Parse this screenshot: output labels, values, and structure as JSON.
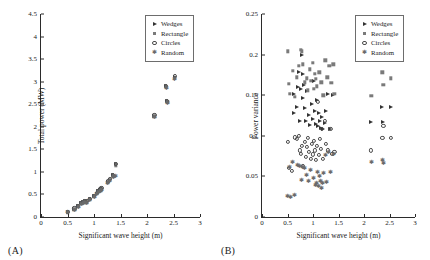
{
  "figure": {
    "panels": [
      {
        "tag": "(A)",
        "xlabel": "Significant wave height (m)",
        "ylabel": "Total power (MW)",
        "xticks": [
          "0",
          "0.5",
          "1",
          "1.5",
          "2",
          "2.5",
          "3"
        ],
        "yticks": [
          "0",
          "0.5",
          "1",
          "1.5",
          "2",
          "2.5",
          "3",
          "3.5",
          "4",
          "4.5"
        ]
      },
      {
        "tag": "(B)",
        "xlabel": "Significant wave height (m)",
        "ylabel": "Power variance",
        "xticks": [
          "0",
          "0.5",
          "1",
          "1.5",
          "2",
          "2.5",
          "3"
        ],
        "yticks": [
          "0",
          "0.05",
          "0.1",
          "0.15",
          "0.2",
          "0.25"
        ]
      }
    ],
    "legend": [
      {
        "label": "Wedges",
        "marker": "wedge-marker"
      },
      {
        "label": "Rectangle",
        "marker": "rectangle-marker"
      },
      {
        "label": "Circles",
        "marker": "circle-marker"
      },
      {
        "label": "Random",
        "marker": "random-marker"
      }
    ]
  },
  "chart_data": [
    {
      "type": "scatter",
      "title": "(A)",
      "xlabel": "Significant wave height (m)",
      "ylabel": "Total power (MW)",
      "xlim": [
        0,
        3
      ],
      "ylim": [
        0,
        4.5
      ],
      "xticks": [
        0,
        0.5,
        1,
        1.5,
        2,
        2.5,
        3
      ],
      "yticks": [
        0,
        0.5,
        1,
        1.5,
        2,
        2.5,
        3,
        3.5,
        4,
        4.5
      ],
      "grid": false,
      "legend_position": "top-right",
      "series": [
        {
          "name": "Wedges",
          "points": [
            [
              0.5,
              0.11
            ],
            [
              0.63,
              0.18
            ],
            [
              0.7,
              0.24
            ],
            [
              0.76,
              0.3
            ],
            [
              0.8,
              0.33
            ],
            [
              0.83,
              0.35
            ],
            [
              0.86,
              0.34
            ],
            [
              0.92,
              0.4
            ],
            [
              1.0,
              0.46
            ],
            [
              1.05,
              0.52
            ],
            [
              1.08,
              0.57
            ],
            [
              1.12,
              0.6
            ],
            [
              1.14,
              0.63
            ],
            [
              1.26,
              0.78
            ],
            [
              1.3,
              0.83
            ],
            [
              1.36,
              0.92
            ],
            [
              1.41,
              1.17
            ],
            [
              2.14,
              2.25
            ],
            [
              2.36,
              2.9
            ],
            [
              2.38,
              2.57
            ],
            [
              2.52,
              3.1
            ]
          ]
        },
        {
          "name": "Rectangle",
          "points": [
            [
              0.5,
              0.1
            ],
            [
              0.63,
              0.17
            ],
            [
              0.7,
              0.23
            ],
            [
              0.76,
              0.29
            ],
            [
              0.8,
              0.32
            ],
            [
              0.83,
              0.34
            ],
            [
              0.86,
              0.33
            ],
            [
              0.92,
              0.39
            ],
            [
              1.0,
              0.45
            ],
            [
              1.05,
              0.51
            ],
            [
              1.08,
              0.56
            ],
            [
              1.12,
              0.59
            ],
            [
              1.14,
              0.62
            ],
            [
              1.26,
              0.77
            ],
            [
              1.3,
              0.82
            ],
            [
              1.36,
              0.9
            ],
            [
              1.41,
              1.15
            ],
            [
              2.14,
              2.23
            ],
            [
              2.36,
              2.88
            ],
            [
              2.38,
              2.55
            ],
            [
              2.52,
              3.08
            ]
          ]
        },
        {
          "name": "Circles",
          "points": [
            [
              0.5,
              0.12
            ],
            [
              0.63,
              0.19
            ],
            [
              0.7,
              0.25
            ],
            [
              0.76,
              0.31
            ],
            [
              0.8,
              0.34
            ],
            [
              0.83,
              0.36
            ],
            [
              0.86,
              0.35
            ],
            [
              0.92,
              0.41
            ],
            [
              1.0,
              0.47
            ],
            [
              1.05,
              0.53
            ],
            [
              1.08,
              0.58
            ],
            [
              1.12,
              0.61
            ],
            [
              1.14,
              0.64
            ],
            [
              1.26,
              0.79
            ],
            [
              1.3,
              0.84
            ],
            [
              1.36,
              0.93
            ],
            [
              1.41,
              1.18
            ],
            [
              2.14,
              2.26
            ],
            [
              2.36,
              2.91
            ],
            [
              2.38,
              2.58
            ],
            [
              2.52,
              3.12
            ]
          ]
        },
        {
          "name": "Random",
          "points": [
            [
              0.5,
              0.1
            ],
            [
              0.63,
              0.16
            ],
            [
              0.7,
              0.22
            ],
            [
              0.76,
              0.28
            ],
            [
              0.8,
              0.31
            ],
            [
              0.83,
              0.33
            ],
            [
              0.86,
              0.32
            ],
            [
              0.92,
              0.38
            ],
            [
              1.0,
              0.44
            ],
            [
              1.05,
              0.5
            ],
            [
              1.08,
              0.55
            ],
            [
              1.12,
              0.58
            ],
            [
              1.14,
              0.6
            ],
            [
              1.26,
              0.75
            ],
            [
              1.3,
              0.8
            ],
            [
              1.36,
              0.88
            ],
            [
              1.41,
              0.9
            ],
            [
              2.14,
              2.21
            ],
            [
              2.36,
              2.86
            ],
            [
              2.38,
              2.53
            ],
            [
              2.52,
              3.06
            ]
          ]
        }
      ]
    },
    {
      "type": "scatter",
      "title": "(B)",
      "xlabel": "Significant wave height (m)",
      "ylabel": "Power variance",
      "xlim": [
        0,
        3
      ],
      "ylim": [
        0,
        0.25
      ],
      "xticks": [
        0,
        0.5,
        1,
        1.5,
        2,
        2.5,
        3
      ],
      "yticks": [
        0,
        0.05,
        0.1,
        0.15,
        0.2,
        0.25
      ],
      "grid": false,
      "legend_position": "top-right",
      "series": [
        {
          "name": "Wedges",
          "points": [
            [
              0.62,
              0.128
            ],
            [
              0.63,
              0.152
            ],
            [
              0.68,
              0.135
            ],
            [
              0.7,
              0.16
            ],
            [
              0.72,
              0.178
            ],
            [
              0.74,
              0.118
            ],
            [
              0.76,
              0.158
            ],
            [
              0.78,
              0.2
            ],
            [
              0.8,
              0.176
            ],
            [
              0.8,
              0.146
            ],
            [
              0.82,
              0.162
            ],
            [
              0.84,
              0.134
            ],
            [
              0.86,
              0.118
            ],
            [
              0.88,
              0.155
            ],
            [
              0.92,
              0.126
            ],
            [
              0.95,
              0.113
            ],
            [
              0.98,
              0.139
            ],
            [
              1.0,
              0.121
            ],
            [
              1.02,
              0.168
            ],
            [
              1.04,
              0.131
            ],
            [
              1.06,
              0.115
            ],
            [
              1.08,
              0.144
            ],
            [
              1.1,
              0.112
            ],
            [
              1.12,
              0.128
            ],
            [
              1.14,
              0.118
            ],
            [
              1.16,
              0.11
            ],
            [
              1.18,
              0.123
            ],
            [
              1.2,
              0.108
            ],
            [
              1.24,
              0.116
            ],
            [
              1.26,
              0.131
            ],
            [
              1.3,
              0.152
            ],
            [
              1.34,
              0.108
            ],
            [
              1.4,
              0.15
            ],
            [
              2.14,
              0.117
            ],
            [
              2.36,
              0.135
            ],
            [
              2.38,
              0.117
            ],
            [
              2.52,
              0.135
            ]
          ]
        },
        {
          "name": "Rectangle",
          "points": [
            [
              0.5,
              0.204
            ],
            [
              0.52,
              0.164
            ],
            [
              0.54,
              0.152
            ],
            [
              0.6,
              0.18
            ],
            [
              0.64,
              0.148
            ],
            [
              0.68,
              0.172
            ],
            [
              0.72,
              0.186
            ],
            [
              0.76,
              0.206
            ],
            [
              0.78,
              0.204
            ],
            [
              0.8,
              0.188
            ],
            [
              0.84,
              0.166
            ],
            [
              0.88,
              0.171
            ],
            [
              0.9,
              0.156
            ],
            [
              0.94,
              0.182
            ],
            [
              0.96,
              0.168
            ],
            [
              1.0,
              0.19
            ],
            [
              1.02,
              0.158
            ],
            [
              1.04,
              0.176
            ],
            [
              1.06,
              0.17
            ],
            [
              1.08,
              0.161
            ],
            [
              1.12,
              0.178
            ],
            [
              1.16,
              0.166
            ],
            [
              1.2,
              0.15
            ],
            [
              1.24,
              0.193
            ],
            [
              1.28,
              0.172
            ],
            [
              1.32,
              0.186
            ],
            [
              1.36,
              0.165
            ],
            [
              1.4,
              0.188
            ],
            [
              1.42,
              0.152
            ],
            [
              2.14,
              0.149
            ],
            [
              2.36,
              0.178
            ],
            [
              2.38,
              0.163
            ],
            [
              2.52,
              0.171
            ]
          ]
        },
        {
          "name": "Circles",
          "points": [
            [
              0.5,
              0.092
            ],
            [
              0.52,
              0.06
            ],
            [
              0.58,
              0.057
            ],
            [
              0.64,
              0.098
            ],
            [
              0.68,
              0.096
            ],
            [
              0.72,
              0.1
            ],
            [
              0.74,
              0.082
            ],
            [
              0.76,
              0.078
            ],
            [
              0.78,
              0.088
            ],
            [
              0.8,
              0.063
            ],
            [
              0.84,
              0.092
            ],
            [
              0.86,
              0.074
            ],
            [
              0.88,
              0.086
            ],
            [
              0.9,
              0.097
            ],
            [
              0.92,
              0.08
            ],
            [
              0.96,
              0.072
            ],
            [
              0.98,
              0.09
            ],
            [
              1.0,
              0.077
            ],
            [
              1.02,
              0.094
            ],
            [
              1.04,
              0.082
            ],
            [
              1.06,
              0.07
            ],
            [
              1.08,
              0.088
            ],
            [
              1.1,
              0.142
            ],
            [
              1.12,
              0.076
            ],
            [
              1.14,
              0.096
            ],
            [
              1.16,
              0.084
            ],
            [
              1.18,
              0.108
            ],
            [
              1.2,
              0.072
            ],
            [
              1.24,
              0.118
            ],
            [
              1.26,
              0.09
            ],
            [
              1.3,
              0.082
            ],
            [
              1.34,
              0.108
            ],
            [
              1.38,
              0.078
            ],
            [
              1.42,
              0.08
            ],
            [
              2.14,
              0.082
            ],
            [
              2.36,
              0.097
            ],
            [
              2.38,
              0.112
            ],
            [
              2.52,
              0.097
            ]
          ]
        },
        {
          "name": "Random",
          "points": [
            [
              0.5,
              0.026
            ],
            [
              0.54,
              0.062
            ],
            [
              0.56,
              0.025
            ],
            [
              0.6,
              0.068
            ],
            [
              0.64,
              0.027
            ],
            [
              0.7,
              0.064
            ],
            [
              0.74,
              0.063
            ],
            [
              0.78,
              0.046
            ],
            [
              0.8,
              0.061
            ],
            [
              0.84,
              0.06
            ],
            [
              0.88,
              0.052
            ],
            [
              0.92,
              0.044
            ],
            [
              0.96,
              0.058
            ],
            [
              1.0,
              0.048
            ],
            [
              1.04,
              0.04
            ],
            [
              1.06,
              0.042
            ],
            [
              1.08,
              0.056
            ],
            [
              1.1,
              0.038
            ],
            [
              1.12,
              0.05
            ],
            [
              1.14,
              0.044
            ],
            [
              1.16,
              0.036
            ],
            [
              1.18,
              0.042
            ],
            [
              1.2,
              0.054
            ],
            [
              1.24,
              0.076
            ],
            [
              1.26,
              0.043
            ],
            [
              1.3,
              0.08
            ],
            [
              1.34,
              0.055
            ],
            [
              1.4,
              0.078
            ],
            [
              2.14,
              0.068
            ],
            [
              2.36,
              0.07
            ],
            [
              2.38,
              0.066
            ]
          ]
        }
      ]
    }
  ]
}
